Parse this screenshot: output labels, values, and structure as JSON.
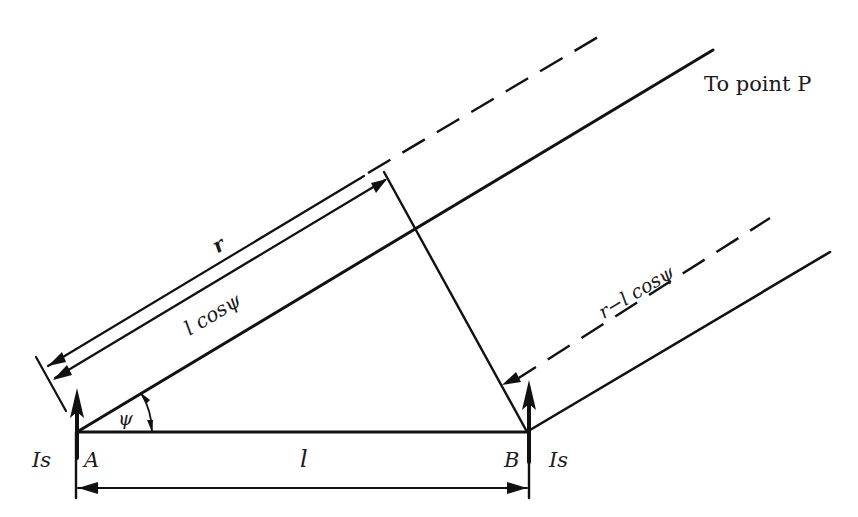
{
  "diagram": {
    "labels": {
      "to_point": "To point P",
      "r": "r",
      "l_cos_psi": "l cosψ",
      "r_minus_l_cos_psi": "r−l cosψ",
      "psi": "ψ",
      "l": "l",
      "point_a": "A",
      "point_b": "B",
      "source_a": "Is",
      "source_b": "Is"
    },
    "points": {
      "A": [
        77,
        432
      ],
      "B": [
        528,
        432
      ]
    },
    "angle_psi_deg": 31,
    "colors": {
      "line": "#111111",
      "text": "#1a1a1a",
      "background": "#ffffff"
    },
    "elements": [
      {
        "id": "baseline-ab",
        "type": "solid-line",
        "desc": "Line from A to B of length l"
      },
      {
        "id": "ray-from-a",
        "type": "solid-line",
        "desc": "Ray from A toward point P at angle psi"
      },
      {
        "id": "ray-from-b",
        "type": "solid-line",
        "desc": "Parallel ray from B toward point P"
      },
      {
        "id": "perpendicular-from-b",
        "type": "solid-line",
        "desc": "Perpendicular from B to the ray direction"
      },
      {
        "id": "dim-r",
        "type": "dimension-arrow",
        "label": "r"
      },
      {
        "id": "dim-lcospsi",
        "type": "dimension-arrow",
        "label": "l cosψ"
      },
      {
        "id": "dim-r-minus-lcospsi",
        "type": "dashed-dimension-arrow",
        "label": "r−l cosψ"
      },
      {
        "id": "dim-l",
        "type": "dimension-arrow",
        "label": "l"
      },
      {
        "id": "current-arrow-a",
        "type": "bold-arrow",
        "label": "Is"
      },
      {
        "id": "current-arrow-b",
        "type": "bold-arrow",
        "label": "Is"
      }
    ]
  }
}
